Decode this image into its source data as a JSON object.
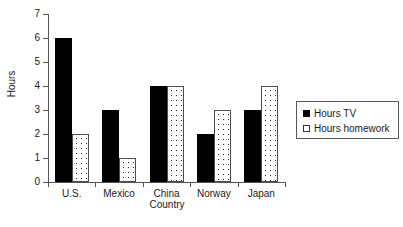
{
  "chart_data": {
    "type": "bar",
    "title": "",
    "xlabel": "Country",
    "ylabel": "Hours",
    "categories": [
      "U.S.",
      "Mexico",
      "China",
      "Norway",
      "Japan"
    ],
    "series": [
      {
        "name": "Hours TV",
        "values": [
          6,
          3,
          4,
          2,
          3
        ],
        "color": "#000000",
        "fill": "solid-black"
      },
      {
        "name": "Hours homework",
        "values": [
          2,
          1,
          4,
          3,
          4
        ],
        "color": "#ffffff",
        "fill": "white-dotted"
      }
    ],
    "ylim": [
      0,
      7
    ],
    "yticks": [
      0,
      1,
      2,
      3,
      4,
      5,
      6,
      7
    ],
    "ytick_labels": [
      "0",
      "1",
      "2",
      "3",
      "4",
      "5",
      "6",
      "7"
    ],
    "grid": false,
    "legend_position": "right"
  },
  "legend": {
    "entries": [
      {
        "label": "Hours TV",
        "swatch": "solid-black-square"
      },
      {
        "label": "Hours homework",
        "swatch": "white-dotted-square"
      }
    ]
  },
  "axes": {
    "y_title": "Hours",
    "x_title": "Country"
  }
}
